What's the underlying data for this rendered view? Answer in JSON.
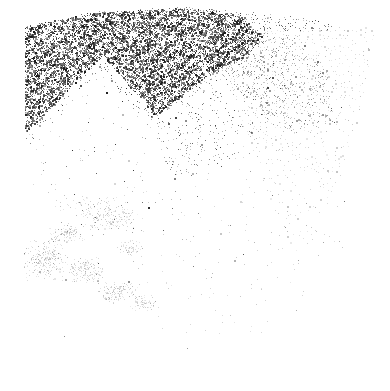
{
  "image": {
    "description": "Abstract monochrome grunge texture: dense black grain cloud at top-left with a white pyramid-shaped notch, a fading halftone dot wedge on the right, a faint gray smudge at bottom-left, and sparse specks across the middle; bottom-right is blank white",
    "width": 390,
    "height": 391,
    "background_color": "#ffffff"
  },
  "palette": {
    "ink_dark": "#181818",
    "ink_mid": "#555555",
    "ink_light": "#9a9a9a",
    "halftone_dot": "#c2c2c2",
    "halftone_faint": "#dfdfdf",
    "smudge": "#cdcdcd",
    "white": "#ffffff"
  },
  "layers": [
    {
      "name": "halftone-wedge",
      "type": "grid",
      "seed": 11,
      "polygon": [
        [
          212,
          30
        ],
        [
          375,
          27
        ],
        [
          367,
          78
        ],
        [
          353,
          138
        ],
        [
          335,
          192
        ],
        [
          318,
          233
        ],
        [
          297,
          266
        ],
        [
          284,
          233
        ],
        [
          269,
          197
        ],
        [
          253,
          152
        ],
        [
          237,
          108
        ],
        [
          221,
          66
        ]
      ],
      "spacing": 4,
      "jitter": 1.3,
      "base_prob": 0.52,
      "fade": {
        "y0": 95,
        "y1": 252,
        "min": 0.2
      },
      "colors": [
        [
          "#b4b4b4",
          0.2
        ],
        [
          "#c2c2c2",
          0.3
        ],
        [
          "#d0d0d0",
          0.3
        ],
        [
          "#dfdfdf",
          0.2
        ]
      ],
      "big_dot_prob": 0.1
    },
    {
      "name": "halftone-transition-noise",
      "type": "speckles",
      "seed": 22,
      "polygon": [
        [
          208,
          32
        ],
        [
          296,
          33
        ],
        [
          327,
          69
        ],
        [
          334,
          126
        ],
        [
          292,
          133
        ],
        [
          243,
          96
        ],
        [
          213,
          60
        ]
      ],
      "attempts": 2600,
      "accept": 0.3,
      "colors": [
        [
          "#6e6e6e",
          0.2
        ],
        [
          "#8a8a8a",
          0.45
        ],
        [
          "#a6a6a6",
          0.35
        ]
      ],
      "size2_prob": 0.08
    },
    {
      "name": "grain-top-fringe",
      "type": "speckles",
      "seed": 33,
      "polygon": [
        [
          58,
          26
        ],
        [
          95,
          11
        ],
        [
          185,
          7
        ],
        [
          282,
          15
        ],
        [
          332,
          23
        ],
        [
          332,
          31
        ],
        [
          58,
          31
        ]
      ],
      "attempts": 2200,
      "accept": 0.28,
      "colors": [
        [
          "#3a3a3a",
          0.4
        ],
        [
          "#6e6e6e",
          0.35
        ],
        [
          "#9a9a9a",
          0.25
        ]
      ],
      "size2_prob": 0.05
    },
    {
      "name": "grain-cloud",
      "type": "speckles",
      "seed": 44,
      "polygon": [
        [
          25,
          27
        ],
        [
          90,
          13
        ],
        [
          190,
          8
        ],
        [
          240,
          15
        ],
        [
          263,
          37
        ],
        [
          249,
          54
        ],
        [
          206,
          79
        ],
        [
          151,
          119
        ],
        [
          119,
          149
        ],
        [
          62,
          152
        ],
        [
          25,
          142
        ]
      ],
      "notch": [
        [
          103,
          55
        ],
        [
          160,
          122
        ],
        [
          200,
          210
        ],
        [
          0,
          210
        ],
        [
          20,
          140
        ]
      ],
      "attempts": 36000,
      "accept": 0.62,
      "streaks": {
        "px": 0.61,
        "py": 0.79,
        "freq": 0.55,
        "amp": 0.6
      },
      "fade_y": {
        "from": 95,
        "to": 165,
        "min": 0.55
      },
      "colors": [
        [
          "#181818",
          0.45
        ],
        [
          "#3c3c3c",
          0.3
        ],
        [
          "#686868",
          0.17
        ],
        [
          "#9a9a9a",
          0.08
        ]
      ],
      "size2_prob": 0.22
    },
    {
      "name": "grain-fade-tail",
      "type": "speckles",
      "seed": 55,
      "polygon": [
        [
          148,
          122
        ],
        [
          256,
          37
        ],
        [
          298,
          72
        ],
        [
          278,
          122
        ],
        [
          224,
          166
        ],
        [
          174,
          182
        ]
      ],
      "attempts": 3000,
      "accept": 0.22,
      "colors": [
        [
          "#3c3c3c",
          0.3
        ],
        [
          "#757575",
          0.4
        ],
        [
          "#a5a5a5",
          0.3
        ]
      ],
      "size2_prob": 0.05
    },
    {
      "name": "pyramid-left-slope-fuzz",
      "type": "speckles",
      "seed": 66,
      "polygon": [
        [
          102,
          54
        ],
        [
          109,
          61
        ],
        [
          32,
          147
        ],
        [
          23,
          139
        ]
      ],
      "attempts": 800,
      "accept": 0.3,
      "colors": [
        [
          "#2a2a2a",
          0.5
        ],
        [
          "#777777",
          0.5
        ]
      ],
      "size2_prob": 0.05
    },
    {
      "name": "pyramid-right-slope-fuzz",
      "type": "speckles",
      "seed": 77,
      "polygon": [
        [
          100,
          56
        ],
        [
          153,
          117
        ],
        [
          147,
          125
        ],
        [
          95,
          63
        ]
      ],
      "attempts": 800,
      "accept": 0.28,
      "colors": [
        [
          "#2a2a2a",
          0.45
        ],
        [
          "#777777",
          0.55
        ]
      ],
      "size2_prob": 0.05
    },
    {
      "name": "central-scatter",
      "type": "speckles",
      "seed": 88,
      "polygon": [
        [
          28,
          52
        ],
        [
          345,
          52
        ],
        [
          345,
          258
        ],
        [
          298,
          268
        ],
        [
          134,
          268
        ],
        [
          28,
          186
        ]
      ],
      "attempts": 3000,
      "accept": 0.13,
      "colors": [
        [
          "#c9c9c9",
          0.5
        ],
        [
          "#b3b3b3",
          0.26
        ],
        [
          "#959595",
          0.14
        ],
        [
          "#4f4f4f",
          0.1
        ]
      ],
      "size2_prob": 0.04
    },
    {
      "name": "bottom-center-scatter",
      "type": "speckles",
      "seed": 99,
      "polygon": [
        [
          132,
          262
        ],
        [
          308,
          262
        ],
        [
          298,
          332
        ],
        [
          152,
          336
        ]
      ],
      "attempts": 600,
      "accept": 0.1,
      "colors": [
        [
          "#d4d4d4",
          0.55
        ],
        [
          "#c2c2c2",
          0.3
        ],
        [
          "#a9a9a9",
          0.15
        ]
      ],
      "size2_prob": 0
    },
    {
      "name": "bottom-left-smudge",
      "type": "clusters",
      "seed": 110,
      "clusters": [
        {
          "cx": 110,
          "cy": 218,
          "rx": 30,
          "ry": 13,
          "count": 150
        },
        {
          "cx": 68,
          "cy": 233,
          "rx": 20,
          "ry": 11,
          "count": 100
        },
        {
          "cx": 46,
          "cy": 260,
          "rx": 26,
          "ry": 22,
          "count": 260
        },
        {
          "cx": 86,
          "cy": 270,
          "rx": 21,
          "ry": 14,
          "count": 150
        },
        {
          "cx": 118,
          "cy": 292,
          "rx": 22,
          "ry": 12,
          "count": 130
        },
        {
          "cx": 143,
          "cy": 303,
          "rx": 14,
          "ry": 8,
          "count": 70
        },
        {
          "cx": 130,
          "cy": 248,
          "rx": 14,
          "ry": 9,
          "count": 55
        },
        {
          "cx": 90,
          "cy": 205,
          "rx": 35,
          "ry": 10,
          "count": 60
        }
      ],
      "colors": [
        [
          "#dcdcdc",
          0.35
        ],
        [
          "#cdcdcd",
          0.3
        ],
        [
          "#bcbcbc",
          0.2
        ],
        [
          "#a3a3a3",
          0.1
        ],
        [
          "#7c7c7c",
          0.05
        ]
      ],
      "size2_prob": 0.03
    },
    {
      "name": "distinct-specks",
      "type": "dots",
      "seed": 120,
      "dots": [
        [
          106,
          92,
          2,
          "#222222"
        ],
        [
          122,
          101,
          1,
          "#333333"
        ],
        [
          115,
          144,
          1,
          "#444444"
        ],
        [
          133,
          170,
          1,
          "#3a3a3a"
        ],
        [
          124,
          181,
          1,
          "#555555"
        ],
        [
          148,
          207,
          2,
          "#2e2e2e"
        ],
        [
          133,
          228,
          1,
          "#555555"
        ],
        [
          98,
          263,
          1,
          "#4a4a4a"
        ],
        [
          72,
          150,
          1,
          "#333333"
        ],
        [
          186,
          125,
          1,
          "#666666"
        ],
        [
          210,
          98,
          1,
          "#555555"
        ],
        [
          243,
          254,
          1,
          "#555555"
        ],
        [
          64,
          336,
          1,
          "#8a8a8a"
        ],
        [
          187,
          348,
          1,
          "#9a9a9a"
        ],
        [
          305,
          120,
          1,
          "#666666"
        ],
        [
          334,
          122,
          1,
          "#555555"
        ],
        [
          88,
          122,
          1,
          "#444444"
        ],
        [
          160,
          90,
          1,
          "#555555"
        ],
        [
          205,
          140,
          1,
          "#777777"
        ],
        [
          230,
          225,
          1,
          "#888888"
        ]
      ]
    }
  ]
}
